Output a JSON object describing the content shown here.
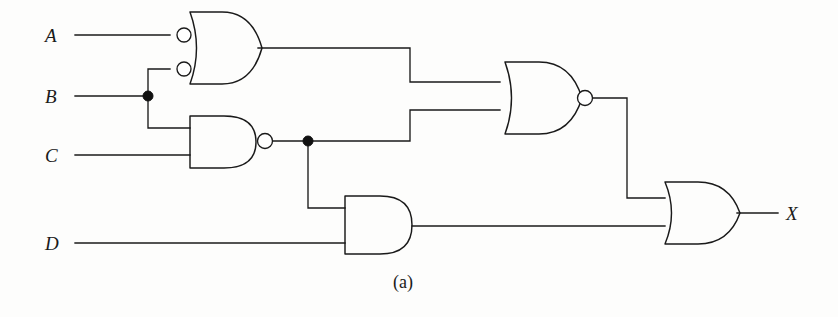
{
  "figure": {
    "caption": "(a)",
    "caption_x": 393,
    "caption_y": 272,
    "width": 838,
    "height": 317,
    "background_color": "#fdfdfc",
    "line_color": "#1a1a1a"
  },
  "inputs": [
    {
      "name": "A",
      "label": "A",
      "x": 45,
      "y": 26,
      "wire_y": 35,
      "wire_x_start": 75,
      "wire_x_end": 178
    },
    {
      "name": "B",
      "label": "B",
      "x": 45,
      "y": 87,
      "wire_y": 96,
      "wire_x_start": 75,
      "wire_x_end": 148
    },
    {
      "name": "C",
      "label": "C",
      "x": 45,
      "y": 146,
      "wire_y": 155,
      "wire_x_start": 75,
      "wire_x_end": 190
    },
    {
      "name": "D",
      "label": "D",
      "x": 45,
      "y": 234,
      "wire_y": 243,
      "wire_x_start": 75,
      "wire_x_end": 345
    }
  ],
  "outputs": [
    {
      "name": "X",
      "label": "X",
      "x": 786,
      "y": 204,
      "wire_y": 213,
      "wire_x_start": 737,
      "wire_x_end": 778
    }
  ],
  "gates": [
    {
      "id": "g1",
      "type": "OR",
      "label": "negative-input-or-gate",
      "inverted_inputs": true,
      "inverted_output": false,
      "inputs": [
        "A",
        "B"
      ],
      "output_to": "NOR gate input 1",
      "body_x": 190,
      "body_y": 12,
      "body_w": 68,
      "body_h": 72,
      "input_ys": [
        35,
        69
      ],
      "output_y": 48
    },
    {
      "id": "g2",
      "type": "NAND",
      "label": "nand-gate",
      "inverted_inputs": false,
      "inverted_output": true,
      "inputs": [
        "B",
        "C"
      ],
      "output_to": "NOR gate input 2 and AND gate input 1",
      "body_x": 190,
      "body_y": 116,
      "body_w": 66,
      "body_h": 52,
      "input_ys": [
        128,
        155
      ],
      "output_y": 141
    },
    {
      "id": "g3",
      "type": "NOR",
      "label": "nor-gate",
      "inverted_inputs": false,
      "inverted_output": true,
      "inputs": [
        "g1",
        "g2"
      ],
      "output_to": "OR gate input 1",
      "body_x": 505,
      "body_y": 62,
      "body_w": 73,
      "body_h": 72,
      "input_ys": [
        82,
        110
      ],
      "output_y": 98
    },
    {
      "id": "g4",
      "type": "AND",
      "label": "and-gate",
      "inverted_inputs": false,
      "inverted_output": false,
      "inputs": [
        "g2",
        "D"
      ],
      "output_to": "OR gate input 2",
      "body_x": 345,
      "body_y": 196,
      "body_w": 67,
      "body_h": 58,
      "input_ys": [
        208,
        243
      ],
      "output_y": 226
    },
    {
      "id": "g5",
      "type": "OR",
      "label": "or-gate-output",
      "inverted_inputs": false,
      "inverted_output": false,
      "inputs": [
        "g3",
        "g4"
      ],
      "output_to": "X",
      "body_x": 665,
      "body_y": 182,
      "body_w": 71,
      "body_h": 62,
      "input_ys": [
        198,
        228
      ],
      "output_y": 213
    }
  ],
  "junctions": [
    {
      "name": "junction-b-fanout",
      "x": 148,
      "y": 96
    },
    {
      "name": "junction-nand-fanout",
      "x": 308,
      "y": 141
    }
  ],
  "wires": [
    {
      "name": "wire-a-to-g1",
      "d": "M 75 35 H 170"
    },
    {
      "name": "wire-b-to-junction",
      "d": "M 75 96 H 148"
    },
    {
      "name": "wire-b-up-to-g1",
      "d": "M 148 96 V 69 H 170"
    },
    {
      "name": "wire-b-down-to-g2",
      "d": "M 148 96 V 128 H 190"
    },
    {
      "name": "wire-c-to-g2",
      "d": "M 75 155 H 190"
    },
    {
      "name": "wire-d-to-g4",
      "d": "M 75 243 H 345"
    },
    {
      "name": "wire-g1-out-to-g3",
      "d": "M 258 48 H 410 V 82 H 500"
    },
    {
      "name": "wire-g2-out-to-junction",
      "d": "M 272 141 H 308"
    },
    {
      "name": "wire-junction-to-g3",
      "d": "M 308 141 H 410 V 110 H 500"
    },
    {
      "name": "wire-junction-down-to-g4",
      "d": "M 308 141 V 208 H 345"
    },
    {
      "name": "wire-g3-out-to-g5",
      "d": "M 591 98 H 627 V 198 H 665"
    },
    {
      "name": "wire-g4-out-to-g5",
      "d": "M 412 226 H 665"
    },
    {
      "name": "wire-g5-out-to-x",
      "d": "M 737 213 H 778"
    }
  ],
  "gate_shapes": {
    "g1_body": "M 190 12 L 222 12 Q 252 12 262 48 Q 252 84 222 84 L 190 84 Q 203 48 190 12 Z",
    "g2_body": "M 190 116 L 224 116 Q 256 116 256 142 Q 256 168 224 168 L 190 168 Z",
    "g3_body": "M 505 62 L 539 62 Q 571 62 582 98 Q 571 134 539 134 L 505 134 Q 518 98 505 62 Z",
    "g4_body": "M 345 196 L 380 196 Q 412 196 412 225 Q 412 254 380 254 L 345 254 Z",
    "g5_body": "M 665 182 L 698 182 Q 729 182 740 213 Q 729 244 698 244 L 665 244 Q 678 213 665 182 Z"
  },
  "bubbles": [
    {
      "name": "bubble-g1-input-a",
      "cx": 184,
      "cy": 35,
      "r": 7
    },
    {
      "name": "bubble-g1-input-b",
      "cx": 184,
      "cy": 69,
      "r": 7
    },
    {
      "name": "bubble-g2-output",
      "cx": 265,
      "cy": 141,
      "r": 7.5
    },
    {
      "name": "bubble-g3-output",
      "cx": 585,
      "cy": 98,
      "r": 7.5
    }
  ]
}
